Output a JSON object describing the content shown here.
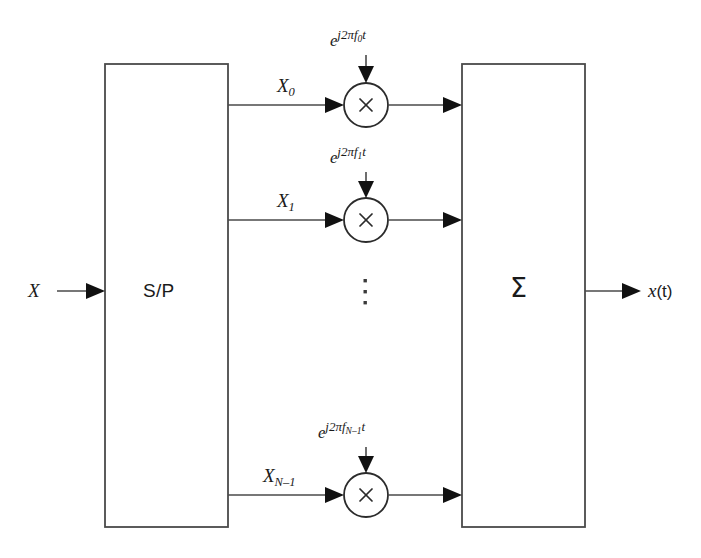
{
  "figure": {
    "kind": "block-diagram",
    "background_color": "#ffffff",
    "line_color": "#4a4a4a",
    "text_color": "#1a1a1a"
  },
  "input": {
    "label": "X",
    "arrow": "right-arrow-icon"
  },
  "output": {
    "label_math": "x",
    "label_arg": "(t)",
    "label_full": "x(t)",
    "arrow": "right-arrow-icon"
  },
  "blocks": [
    {
      "id": "serial-to-parallel",
      "label": "S/P",
      "description": "Serial to Parallel converter"
    },
    {
      "id": "summer",
      "label": "Σ",
      "description": "Summation block"
    }
  ],
  "branches": [
    {
      "index": 0,
      "signal_base": "X",
      "signal_sub": "0",
      "signal_full": "X0",
      "carrier_base": "e",
      "carrier_exp_prefix": "j2πf",
      "carrier_exp_sub": "0",
      "carrier_exp_suffix": "t",
      "carrier_full": "e^{j2πf0t}",
      "multiplier_symbol": "×"
    },
    {
      "index": 1,
      "signal_base": "X",
      "signal_sub": "1",
      "signal_full": "X1",
      "carrier_base": "e",
      "carrier_exp_prefix": "j2πf",
      "carrier_exp_sub": "1",
      "carrier_exp_suffix": "t",
      "carrier_full": "e^{j2πf1t}",
      "multiplier_symbol": "×"
    },
    {
      "index": 2,
      "signal_base": "X",
      "signal_sub": "N–1",
      "signal_full": "XN–1",
      "carrier_base": "e",
      "carrier_exp_prefix": "j2πf",
      "carrier_exp_sub": "N–1",
      "carrier_exp_suffix": "t",
      "carrier_full": "e^{j2πfN–1t}",
      "multiplier_symbol": "×"
    }
  ],
  "ellipsis": {
    "glyph": "⋮",
    "meaning": "additional subcarrier branches omitted"
  }
}
